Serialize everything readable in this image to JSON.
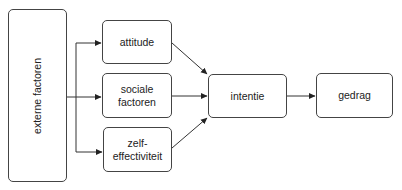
{
  "diagram": {
    "nodes": {
      "externe": "externe factoren",
      "attitude": "attitude",
      "sociale_1": "sociale",
      "sociale_2": "factoren",
      "zelf_1": "zelf-",
      "zelf_2": "effectiviteit",
      "intentie": "intentie",
      "gedrag": "gedrag"
    },
    "edges": [
      {
        "from": "externe factoren",
        "to": "attitude"
      },
      {
        "from": "externe factoren",
        "to": "sociale factoren"
      },
      {
        "from": "externe factoren",
        "to": "zelf-effectiviteit"
      },
      {
        "from": "attitude",
        "to": "intentie"
      },
      {
        "from": "sociale factoren",
        "to": "intentie"
      },
      {
        "from": "zelf-effectiviteit",
        "to": "intentie"
      },
      {
        "from": "intentie",
        "to": "gedrag"
      }
    ]
  }
}
